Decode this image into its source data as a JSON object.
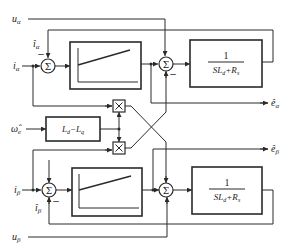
{
  "inputs": {
    "u_alpha": "u",
    "u_alpha_sub": "α",
    "i_alpha": "i",
    "i_alpha_sub": "α",
    "i_alpha_hat": "î",
    "i_alpha_hat_sub": "α",
    "omega_hat": "ω̂",
    "omega_hat_sub": "e",
    "i_beta": "i",
    "i_beta_sub": "β",
    "i_beta_hat": "î",
    "i_beta_hat_sub": "β",
    "u_beta": "u",
    "u_beta_sub": "β"
  },
  "outputs": {
    "e_alpha_hat": "ê",
    "e_alpha_hat_sub": "α",
    "e_beta_hat": "ê",
    "e_beta_hat_sub": "β"
  },
  "blocks": {
    "sum_symbol": "Σ",
    "minus_sign": "−",
    "multiply_symbol": "×",
    "ld_lq": "L",
    "ld_lq_text": "Ld−Lq",
    "plant_num": "1",
    "plant_den": "SLd+Rs"
  }
}
